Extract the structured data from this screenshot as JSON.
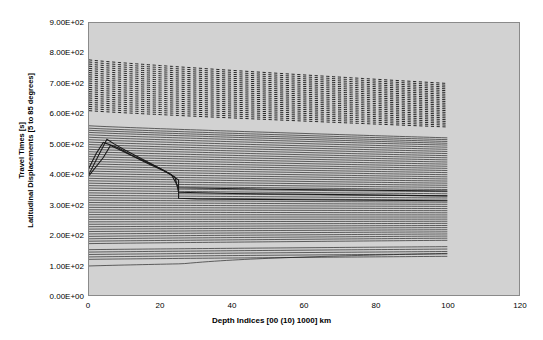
{
  "chart_data": {
    "type": "line",
    "title": "",
    "xlabel": "Depth Indices [00 (10) 1000] km",
    "ylabel_line1": "Travel Times [s]",
    "ylabel_line2": "Latitudinal Displacements [5 to 85 degrees]",
    "xlim": [
      0,
      120
    ],
    "ylim": [
      0,
      900
    ],
    "xticks": [
      0,
      20,
      40,
      60,
      80,
      100,
      120
    ],
    "xtick_labels": [
      "0",
      "20",
      "40",
      "60",
      "80",
      "100",
      "120"
    ],
    "yticks": [
      0,
      100,
      200,
      300,
      400,
      500,
      600,
      700,
      800,
      900
    ],
    "ytick_labels": [
      "0.00E+00",
      "1.00E+02",
      "2.00E+02",
      "3.00E+02",
      "4.00E+02",
      "5.00E+02",
      "6.00E+02",
      "7.00E+02",
      "8.00E+02",
      "9.00E+02"
    ],
    "grid": false,
    "legend": "none",
    "plot_bg_color": "#d2d2d2",
    "line_color": "#1a1a1a",
    "x_data_range": [
      0,
      100
    ],
    "x_step": 1,
    "note": "Dense family of travel-time curves (5 to 85 degrees latitudinal displacement) versus depth index 0..100. Upper band (approx 600-780 s) drawn with dashed strokes; lower band (approx 80-560 s) drawn solid.",
    "series": [
      {
        "name": "85 deg",
        "style": "dashed",
        "y_start": 778,
        "y_end": 700,
        "kink": null
      },
      {
        "name": "84 deg",
        "style": "dashed",
        "y_start": 771,
        "y_end": 694,
        "kink": null
      },
      {
        "name": "83 deg",
        "style": "dashed",
        "y_start": 764,
        "y_end": 688,
        "kink": null
      },
      {
        "name": "82 deg",
        "style": "dashed",
        "y_start": 757,
        "y_end": 682,
        "kink": null
      },
      {
        "name": "81 deg",
        "style": "dashed",
        "y_start": 750,
        "y_end": 676,
        "kink": null
      },
      {
        "name": "80 deg",
        "style": "dashed",
        "y_start": 743,
        "y_end": 670,
        "kink": null
      },
      {
        "name": "79 deg",
        "style": "dashed",
        "y_start": 736,
        "y_end": 664,
        "kink": null
      },
      {
        "name": "78 deg",
        "style": "dashed",
        "y_start": 729,
        "y_end": 658,
        "kink": null
      },
      {
        "name": "77 deg",
        "style": "dashed",
        "y_start": 722,
        "y_end": 652,
        "kink": null
      },
      {
        "name": "76 deg",
        "style": "dashed",
        "y_start": 715,
        "y_end": 646,
        "kink": null
      },
      {
        "name": "75 deg",
        "style": "dashed",
        "y_start": 708,
        "y_end": 640,
        "kink": null
      },
      {
        "name": "74 deg",
        "style": "dashed",
        "y_start": 701,
        "y_end": 634,
        "kink": null
      },
      {
        "name": "73 deg",
        "style": "dashed",
        "y_start": 694,
        "y_end": 628,
        "kink": null
      },
      {
        "name": "72 deg",
        "style": "dashed",
        "y_start": 687,
        "y_end": 622,
        "kink": null
      },
      {
        "name": "71 deg",
        "style": "dashed",
        "y_start": 680,
        "y_end": 616,
        "kink": null
      },
      {
        "name": "70 deg",
        "style": "dashed",
        "y_start": 673,
        "y_end": 610,
        "kink": null
      },
      {
        "name": "69 deg",
        "style": "dashed",
        "y_start": 666,
        "y_end": 604,
        "kink": null
      },
      {
        "name": "68 deg",
        "style": "dashed",
        "y_start": 659,
        "y_end": 598,
        "kink": null
      },
      {
        "name": "67 deg",
        "style": "dashed",
        "y_start": 652,
        "y_end": 592,
        "kink": null
      },
      {
        "name": "66 deg",
        "style": "dashed",
        "y_start": 645,
        "y_end": 586,
        "kink": null
      },
      {
        "name": "65 deg",
        "style": "dashed",
        "y_start": 638,
        "y_end": 580,
        "kink": null
      },
      {
        "name": "64 deg",
        "style": "dashed",
        "y_start": 631,
        "y_end": 574,
        "kink": null
      },
      {
        "name": "63 deg",
        "style": "dashed",
        "y_start": 624,
        "y_end": 568,
        "kink": null
      },
      {
        "name": "62 deg",
        "style": "dashed",
        "y_start": 617,
        "y_end": 562,
        "kink": null
      },
      {
        "name": "61 deg",
        "style": "dashed",
        "y_start": 610,
        "y_end": 556,
        "kink": null
      },
      {
        "name": "60 deg",
        "style": "solid",
        "y_start": 560,
        "y_end": 520,
        "kink": null
      },
      {
        "name": "59 deg",
        "style": "solid",
        "y_start": 552,
        "y_end": 514,
        "kink": null
      },
      {
        "name": "58 deg",
        "style": "solid",
        "y_start": 545,
        "y_end": 508,
        "kink": null
      },
      {
        "name": "57 deg",
        "style": "solid",
        "y_start": 538,
        "y_end": 502,
        "kink": null
      },
      {
        "name": "56 deg",
        "style": "solid",
        "y_start": 530,
        "y_end": 496,
        "kink": null
      },
      {
        "name": "55 deg",
        "style": "solid",
        "y_start": 522,
        "y_end": 489,
        "kink": null
      },
      {
        "name": "54 deg",
        "style": "solid",
        "y_start": 514,
        "y_end": 482,
        "kink": null
      },
      {
        "name": "53 deg",
        "style": "solid",
        "y_start": 506,
        "y_end": 475,
        "kink": null
      },
      {
        "name": "52 deg",
        "style": "solid",
        "y_start": 498,
        "y_end": 468,
        "kink": null
      },
      {
        "name": "51 deg",
        "style": "solid",
        "y_start": 490,
        "y_end": 461,
        "kink": null
      },
      {
        "name": "50 deg",
        "style": "solid",
        "y_start": 482,
        "y_end": 454,
        "kink": null
      },
      {
        "name": "49 deg",
        "style": "solid",
        "y_start": 474,
        "y_end": 447,
        "kink": null
      },
      {
        "name": "48 deg",
        "style": "solid",
        "y_start": 466,
        "y_end": 440,
        "kink": null
      },
      {
        "name": "47 deg",
        "style": "solid",
        "y_start": 458,
        "y_end": 433,
        "kink": null
      },
      {
        "name": "46 deg",
        "style": "solid",
        "y_start": 450,
        "y_end": 426,
        "kink": null
      },
      {
        "name": "45 deg",
        "style": "solid",
        "y_start": 442,
        "y_end": 419,
        "kink": null
      },
      {
        "name": "44 deg",
        "style": "solid",
        "y_start": 434,
        "y_end": 412,
        "kink": null
      },
      {
        "name": "43 deg",
        "style": "solid",
        "y_start": 426,
        "y_end": 405,
        "kink": null
      },
      {
        "name": "42 deg",
        "style": "solid",
        "y_start": 418,
        "y_end": 398,
        "kink": null
      },
      {
        "name": "41 deg",
        "style": "solid",
        "y_start": 410,
        "y_end": 391,
        "kink": null
      },
      {
        "name": "40 deg",
        "style": "solid",
        "y_start": 402,
        "y_end": 384,
        "kink": null
      },
      {
        "name": "39 deg",
        "style": "solid",
        "y_start": 394,
        "y_end": 377,
        "kink": null
      },
      {
        "name": "38 deg",
        "style": "solid",
        "y_start": 386,
        "y_end": 370,
        "kink": null
      },
      {
        "name": "37 deg",
        "style": "solid",
        "y_start": 378,
        "y_end": 363,
        "kink": null
      },
      {
        "name": "36 deg",
        "style": "solid",
        "y_start": 370,
        "y_end": 356,
        "kink": null
      },
      {
        "name": "35 deg",
        "style": "solid",
        "y_start": 362,
        "y_end": 349,
        "kink": null
      },
      {
        "name": "34 deg",
        "style": "solid",
        "y_start": 354,
        "y_end": 342,
        "kink": null
      },
      {
        "name": "33 deg",
        "style": "solid",
        "y_start": 346,
        "y_end": 335,
        "kink": null
      },
      {
        "name": "32 deg",
        "style": "solid",
        "y_start": 338,
        "y_end": 328,
        "kink": null
      },
      {
        "name": "31 deg",
        "style": "solid",
        "y_start": 330,
        "y_end": 321,
        "kink": null
      },
      {
        "name": "30 deg",
        "style": "solid",
        "y_start": 322,
        "y_end": 314,
        "kink": null
      },
      {
        "name": "29 deg",
        "style": "solid",
        "y_start": 314,
        "y_end": 307,
        "kink": null
      },
      {
        "name": "28 deg",
        "style": "solid",
        "y_start": 306,
        "y_end": 300,
        "kink": null
      },
      {
        "name": "27 deg",
        "style": "solid",
        "y_start": 298,
        "y_end": 293,
        "kink": null
      },
      {
        "name": "26 deg",
        "style": "solid",
        "y_start": 290,
        "y_end": 286,
        "kink": null
      },
      {
        "name": "25 deg",
        "style": "solid",
        "y_start": 282,
        "y_end": 279,
        "kink": null
      },
      {
        "name": "24 deg",
        "style": "solid",
        "y_start": 274,
        "y_end": 272,
        "kink": null
      },
      {
        "name": "23 deg",
        "style": "solid",
        "y_start": 266,
        "y_end": 265,
        "kink": null
      },
      {
        "name": "22 deg",
        "style": "solid",
        "y_start": 258,
        "y_end": 258,
        "kink": null
      },
      {
        "name": "21 deg",
        "style": "solid",
        "y_start": 250,
        "y_end": 251,
        "kink": null
      },
      {
        "name": "20 deg",
        "style": "solid",
        "y_start": 242,
        "y_end": 244,
        "kink": null
      },
      {
        "name": "19 deg",
        "style": "solid",
        "y_start": 234,
        "y_end": 237,
        "kink": null
      },
      {
        "name": "18 deg",
        "style": "solid",
        "y_start": 226,
        "y_end": 230,
        "kink": null
      },
      {
        "name": "17 deg",
        "style": "solid",
        "y_start": 218,
        "y_end": 223,
        "kink": null
      },
      {
        "name": "16 deg",
        "style": "solid",
        "y_start": 210,
        "y_end": 216,
        "kink": null
      },
      {
        "name": "15 deg",
        "style": "solid",
        "y_start": 202,
        "y_end": 209,
        "kink": null
      },
      {
        "name": "14 deg",
        "style": "solid",
        "y_start": 194,
        "y_end": 202,
        "kink": null
      },
      {
        "name": "13 deg",
        "style": "solid",
        "y_start": 186,
        "y_end": 195,
        "kink": null
      },
      {
        "name": "12 deg",
        "style": "solid",
        "y_start": 178,
        "y_end": 188,
        "kink": null
      },
      {
        "name": "11 deg",
        "style": "solid",
        "y_start": 170,
        "y_end": 181,
        "kink": null
      },
      {
        "name": "10 deg",
        "style": "solid",
        "y_start": 150,
        "y_end": 160,
        "kink": null
      },
      {
        "name": "9 deg",
        "style": "solid",
        "y_start": 142,
        "y_end": 152,
        "kink": null
      },
      {
        "name": "8 deg",
        "style": "solid",
        "y_start": 134,
        "y_end": 144,
        "kink": null
      },
      {
        "name": "7 deg",
        "style": "solid",
        "y_start": 126,
        "y_end": 136,
        "kink": null
      },
      {
        "name": "6 deg",
        "style": "solid",
        "y_start": 118,
        "y_end": 128,
        "kink": null
      },
      {
        "name": "5 deg",
        "style": "solid",
        "y_start": 96,
        "y_end": 120,
        "kink": 25
      }
    ],
    "branch_curves": [
      {
        "name": "triplication-branch-A",
        "points": [
          [
            0,
            400
          ],
          [
            3,
            470
          ],
          [
            5,
            515
          ],
          [
            7,
            500
          ],
          [
            10,
            480
          ],
          [
            14,
            455
          ],
          [
            18,
            430
          ],
          [
            22,
            405
          ],
          [
            25,
            380
          ],
          [
            25,
            320
          ],
          [
            30,
            318
          ],
          [
            60,
            315
          ],
          [
            100,
            312
          ]
        ]
      },
      {
        "name": "triplication-branch-B",
        "points": [
          [
            0,
            395
          ],
          [
            4,
            455
          ],
          [
            6,
            495
          ],
          [
            9,
            478
          ],
          [
            13,
            455
          ],
          [
            17,
            432
          ],
          [
            21,
            410
          ],
          [
            24,
            390
          ],
          [
            25,
            340
          ],
          [
            40,
            336
          ],
          [
            70,
            332
          ],
          [
            100,
            328
          ]
        ]
      },
      {
        "name": "triplication-branch-C",
        "points": [
          [
            0,
            420
          ],
          [
            2,
            468
          ],
          [
            4,
            505
          ],
          [
            8,
            488
          ],
          [
            12,
            462
          ],
          [
            16,
            440
          ],
          [
            20,
            418
          ],
          [
            23,
            398
          ],
          [
            25,
            355
          ],
          [
            50,
            350
          ],
          [
            100,
            344
          ]
        ]
      }
    ]
  }
}
